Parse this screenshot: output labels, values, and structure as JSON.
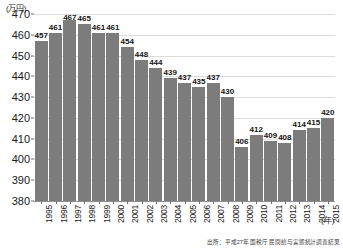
{
  "chart_data": {
    "type": "bar",
    "title": "",
    "xlabel": "(年)",
    "ylabel": "(万円)",
    "ylim": [
      380,
      470
    ],
    "ytick_step": 10,
    "yticks": [
      380,
      390,
      400,
      410,
      420,
      430,
      440,
      450,
      460,
      470
    ],
    "grid": true,
    "legend": "none",
    "bar_color": "#7c7c7c",
    "categories": [
      "1995",
      "1996",
      "1997",
      "1998",
      "1999",
      "2000",
      "2001",
      "2002",
      "2003",
      "2004",
      "2005",
      "2006",
      "2007",
      "2008",
      "2009",
      "2010",
      "2011",
      "2012",
      "2013",
      "2014",
      "2015"
    ],
    "values": [
      457,
      461,
      467,
      465,
      461,
      461,
      454,
      448,
      444,
      439,
      437,
      435,
      437,
      430,
      406,
      412,
      409,
      408,
      414,
      415,
      420
    ],
    "source": "出所：平成27年 国税庁 民間給与実態統計調査結果"
  }
}
